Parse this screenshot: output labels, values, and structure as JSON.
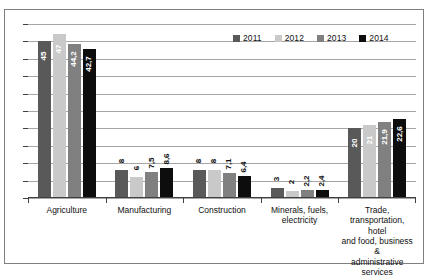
{
  "chart_data": {
    "type": "bar",
    "title": "",
    "xlabel": "",
    "ylabel": "",
    "ylim": [
      0,
      50
    ],
    "grid": true,
    "legend_position": "top-right",
    "categories": [
      "Agriculture",
      "Manufacturing",
      "Construction",
      "Minerals, fuels, electricity",
      "Trade, transportation, hotel and food, business & administrative services"
    ],
    "category_labels": [
      "Agriculture",
      "Manufacturing",
      "Construction",
      "Minerals, fuels,\nelectricity",
      "Trade,\ntransportation, hotel\nand food, business &\nadministrative\nservices"
    ],
    "series": [
      {
        "name": "2011",
        "color": "#595959",
        "values": [
          45,
          8,
          8,
          3,
          20
        ],
        "value_labels": [
          "45",
          "8",
          "8",
          "3",
          "20"
        ]
      },
      {
        "name": "2012",
        "color": "#c9c9c9",
        "values": [
          47,
          6,
          8,
          2,
          21
        ],
        "value_labels": [
          "47",
          "6",
          "8",
          "2",
          "21"
        ]
      },
      {
        "name": "2013",
        "color": "#808080",
        "values": [
          44.2,
          7.5,
          7.1,
          2.2,
          21.9
        ],
        "value_labels": [
          "44,2",
          "7,5",
          "7,1",
          "2,2",
          "21,9"
        ]
      },
      {
        "name": "2014",
        "color": "#0d0d0d",
        "values": [
          42.7,
          8.6,
          6.4,
          2.4,
          22.6
        ],
        "value_labels": [
          "42,7",
          "8,6",
          "6,4",
          "2,4",
          "22,6"
        ]
      }
    ],
    "gridline_count": 10,
    "colors": {
      "gridline": "#a6a6a6",
      "axis": "#404040",
      "border": "#7f7f7f",
      "background": "#ffffff",
      "label_light": "#ffffff",
      "label_dark": "#101010"
    }
  }
}
